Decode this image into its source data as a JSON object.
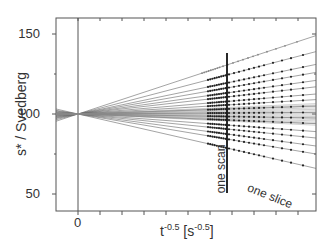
{
  "chart_data": {
    "type": "line",
    "title": "",
    "xlabel_base": "t",
    "xlabel_exp": "-0.5",
    "xlabel_unit_open": " [s",
    "xlabel_unit_exp": "-0.5",
    "xlabel_unit_close": "]",
    "ylabel": "s* / Svedberg",
    "ylim": [
      40,
      150
    ],
    "y_ticks": [
      50,
      100,
      150
    ],
    "x_ticks_labeled": [
      "0"
    ],
    "grid": false,
    "legend": null,
    "origin": {
      "x": 0,
      "y": 100
    },
    "series_right_edge_values": [
      149,
      139,
      131,
      126,
      121,
      117,
      112.5,
      109,
      105,
      101,
      97.5,
      94,
      89,
      85,
      80,
      75,
      66
    ],
    "annotations": [
      {
        "text": "one scan",
        "orientation": "vertical"
      },
      {
        "text": "one slice",
        "orientation": "sloped"
      }
    ]
  },
  "labels": {
    "y150": "150",
    "y100": "100",
    "y50": "50",
    "x0": "0",
    "ylabel": "s* / Svedberg",
    "one_scan": "one scan",
    "one_slice": "one slice"
  }
}
